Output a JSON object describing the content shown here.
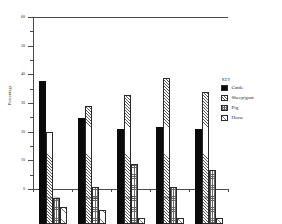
{
  "chart_data": {
    "type": "bar",
    "title": "",
    "xlabel": "",
    "ylabel": "Percentage",
    "ylim": [
      0,
      60
    ],
    "yticks": [
      0,
      10,
      20,
      30,
      40,
      50,
      60
    ],
    "ytick_labels": [
      "0",
      "10",
      "20",
      "30",
      "40",
      "50",
      "60"
    ],
    "grid": false,
    "legend_position": "right",
    "legend_title": "KEY",
    "categories": [
      "Iron Age",
      "Roman",
      "5th C.",
      "6th C.",
      "7th C."
    ],
    "series": [
      {
        "name": "Cattle",
        "pattern": "solid-black",
        "values": [
          50,
          37,
          33,
          34,
          33
        ]
      },
      {
        "name": "Sheep/goat",
        "pattern": "diagonal-hatch",
        "values": [
          32,
          41,
          45,
          51,
          46
        ]
      },
      {
        "name": "Pig",
        "pattern": "cross-hatch",
        "values": [
          9,
          13,
          21,
          13,
          19
        ]
      },
      {
        "name": "Horse",
        "pattern": "light-hatch",
        "values": [
          6,
          5,
          2,
          2,
          2
        ]
      }
    ]
  },
  "axis": {
    "y_title": "Percentage",
    "ticks": [
      {
        "value": 60,
        "label": "60"
      },
      {
        "value": 50,
        "label": "50"
      },
      {
        "value": 40,
        "label": "40"
      },
      {
        "value": 30,
        "label": "30"
      },
      {
        "value": 20,
        "label": "20"
      },
      {
        "value": 10,
        "label": "10"
      },
      {
        "value": 0,
        "label": "0"
      }
    ]
  },
  "categories": [
    {
      "label": "Iron Age"
    },
    {
      "label": "Roman"
    },
    {
      "label": "5th C."
    },
    {
      "label": "6th C."
    },
    {
      "label": "7th C."
    }
  ],
  "legend": {
    "title": "KEY",
    "entries": [
      {
        "label": "Cattle"
      },
      {
        "label": "Sheep/goat"
      },
      {
        "label": "Pig"
      },
      {
        "label": "Horse"
      }
    ]
  }
}
